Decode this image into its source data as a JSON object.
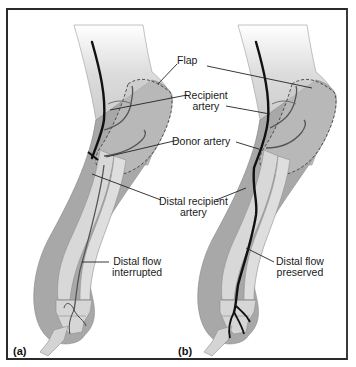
{
  "figure": {
    "panels": [
      {
        "id": "a",
        "label": "(a)",
        "caption": "Distal flow\ninterrupted",
        "caption_line1": "Distal flow",
        "caption_line2": "interrupted"
      },
      {
        "id": "b",
        "label": "(b)",
        "caption": "Distal flow\npreserved",
        "caption_line1": "Distal flow",
        "caption_line2": "preserved"
      }
    ],
    "labels": {
      "flap": "Flap",
      "recipient_artery_line1": "Recipient",
      "recipient_artery_line2": "artery",
      "donor_artery": "Donor artery",
      "distal_recipient_line1": "Distal recipient",
      "distal_recipient_line2": "artery"
    },
    "colors": {
      "frame": "#2a2a2a",
      "skin_light": "#e2e2e2",
      "skin_dark": "#a9a9a9",
      "bone": "#d6d6d6",
      "artery": "#111111",
      "vessel": "#555555",
      "leader": "#222222"
    }
  }
}
